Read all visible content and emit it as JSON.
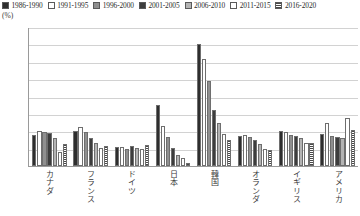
{
  "chart_data": {
    "type": "bar",
    "title": "",
    "xlabel": "",
    "ylabel": "(%)",
    "ylim": [
      0,
      16
    ],
    "yticks": [
      0,
      2,
      4,
      6,
      8,
      10,
      12,
      14,
      16
    ],
    "grid": true,
    "legend_position": "top",
    "categories": [
      "カナダ",
      "フランス",
      "ドイツ",
      "日本",
      "韓国",
      "オランダ",
      "イギリス",
      "アメリカ"
    ],
    "series": [
      {
        "name": "1986-1990",
        "swatch": "solid-black",
        "color": "#2e2e2e",
        "values": [
          3.6,
          4.0,
          2.2,
          7.0,
          14.0,
          3.4,
          4.0,
          3.7
        ]
      },
      {
        "name": "1991-1995",
        "swatch": "white-outline",
        "color": "#ffffff",
        "values": [
          4.0,
          4.5,
          2.2,
          4.6,
          12.3,
          3.6,
          3.9,
          5.0
        ]
      },
      {
        "name": "1996-2000",
        "swatch": "medium-gray",
        "color": "#8f8f8f",
        "values": [
          3.9,
          3.9,
          2.0,
          3.3,
          9.8,
          3.3,
          3.6,
          3.4
        ]
      },
      {
        "name": "2001-2005",
        "swatch": "dark-solid",
        "color": "#3d3d3d",
        "values": [
          3.8,
          3.2,
          2.3,
          2.1,
          6.5,
          3.0,
          3.5,
          3.3
        ]
      },
      {
        "name": "2006-2010",
        "swatch": "light-gray",
        "color": "#b4b4b4",
        "values": [
          3.2,
          2.6,
          2.1,
          1.3,
          5.0,
          2.5,
          3.2,
          3.2
        ]
      },
      {
        "name": "2011-2015",
        "swatch": "white-outline",
        "color": "#ffffff",
        "values": [
          1.6,
          2.1,
          2.0,
          0.9,
          3.7,
          2.0,
          2.6,
          5.5
        ]
      },
      {
        "name": "2016-2020",
        "swatch": "horizontal-hatch",
        "color": "#4a4a4a",
        "values": [
          2.5,
          2.3,
          2.4,
          0.3,
          3.0,
          1.9,
          2.7,
          4.1
        ]
      }
    ]
  }
}
